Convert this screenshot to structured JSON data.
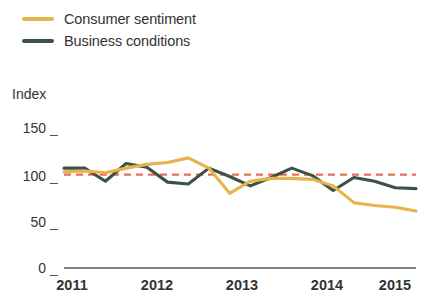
{
  "chart_data": {
    "type": "line",
    "title": "",
    "subtitle": "",
    "xlabel": "",
    "ylabel": "Index",
    "ylim": [
      0,
      150
    ],
    "xlim": [
      2011.0,
      2015.25
    ],
    "yticks": [
      0,
      50,
      100,
      150
    ],
    "ytick_labels": [
      "0",
      "50",
      "100",
      "150"
    ],
    "xticks": [
      2011,
      2012,
      2013,
      2014,
      2015
    ],
    "xtick_labels": [
      "2011",
      "2012",
      "2013",
      "2014",
      "2015"
    ],
    "grid": false,
    "legend_position": "top-left",
    "reference_line": {
      "value": 100,
      "style": "dashed",
      "color": "#E8705A",
      "label": ""
    },
    "x": [
      2011.0,
      2011.25,
      2011.5,
      2011.75,
      2012.0,
      2012.25,
      2012.5,
      2012.75,
      2013.0,
      2013.25,
      2013.5,
      2013.75,
      2014.0,
      2014.25,
      2014.5,
      2014.75,
      2015.0,
      2015.25
    ],
    "series": [
      {
        "name": "Consumer sentiment",
        "color": "#E8B34B",
        "values": [
          103,
          104,
          102,
          107,
          111,
          113,
          118,
          107,
          80,
          93,
          96,
          96,
          95,
          88,
          70,
          67,
          65,
          61
        ]
      },
      {
        "name": "Business conditions",
        "color": "#3D5247",
        "values": [
          107,
          107,
          93,
          112,
          108,
          92,
          90,
          107,
          98,
          88,
          97,
          107,
          99,
          83,
          97,
          93,
          86,
          85
        ]
      }
    ]
  },
  "legend": {
    "items": [
      {
        "label": "Consumer sentiment",
        "color": "#E8B34B"
      },
      {
        "label": "Business conditions",
        "color": "#3D5247"
      }
    ]
  },
  "axes": {
    "y_title": "Index",
    "y_labels": [
      "150",
      "100",
      "50",
      "0"
    ],
    "x_labels": [
      "2011",
      "2012",
      "2013",
      "2014",
      "2015"
    ],
    "tick_dash": "_"
  }
}
